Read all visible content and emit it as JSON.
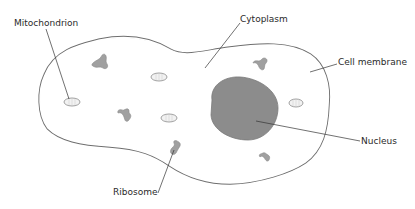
{
  "diagram": {
    "type": "animal cell",
    "colors": {
      "membrane": "#6e6e6e",
      "nucleus": "#8c8c8c",
      "organelle_fill": "#a0a0a0",
      "mitochondrion_fill": "#f2f2f2",
      "text": "#2a2a2a",
      "leader_line": "#333333"
    },
    "labels": {
      "mitochondrion": "Mitochondrion",
      "cytoplasm": "Cytoplasm",
      "cell_membrane": "Cell membrane",
      "nucleus": "Nucleus",
      "ribosome": "Ribosome"
    }
  }
}
